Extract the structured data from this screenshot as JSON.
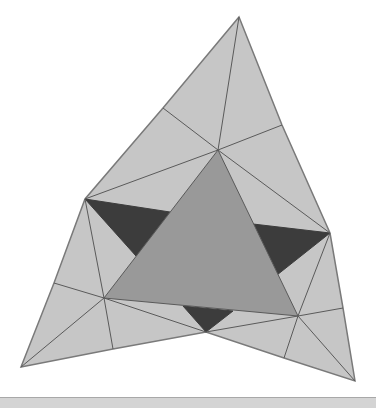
{
  "caption": {
    "text": ""
  },
  "colors": {
    "light": "#c6c6c6",
    "medium": "#999999",
    "dark": "#3c3c3c",
    "stroke": "#5a5a5a",
    "outline": "#7a7a7a"
  },
  "figure": {
    "outer_polygon": [
      [
        239,
        17
      ],
      [
        282,
        125
      ],
      [
        330,
        233
      ],
      [
        343,
        308
      ],
      [
        355,
        381
      ],
      [
        284,
        358
      ],
      [
        206,
        332
      ],
      [
        113,
        349
      ],
      [
        21,
        367
      ],
      [
        54,
        283
      ],
      [
        85,
        199
      ],
      [
        163,
        108
      ]
    ],
    "center_triangle": [
      [
        218,
        150
      ],
      [
        104,
        298
      ],
      [
        298,
        316
      ]
    ],
    "dark_triangles": [
      [
        [
          85,
          199
        ],
        [
          170,
          212
        ],
        [
          136,
          256
        ]
      ],
      [
        [
          253,
          224
        ],
        [
          330,
          233
        ],
        [
          277,
          275
        ]
      ],
      [
        [
          183,
          306
        ],
        [
          233,
          311
        ],
        [
          206,
          332
        ]
      ]
    ],
    "lines": [
      [
        [
          239,
          17
        ],
        [
          218,
          150
        ]
      ],
      [
        [
          163,
          108
        ],
        [
          218,
          150
        ]
      ],
      [
        [
          282,
          125
        ],
        [
          218,
          150
        ]
      ],
      [
        [
          85,
          199
        ],
        [
          218,
          150
        ]
      ],
      [
        [
          330,
          233
        ],
        [
          218,
          150
        ]
      ],
      [
        [
          85,
          199
        ],
        [
          104,
          298
        ]
      ],
      [
        [
          54,
          283
        ],
        [
          104,
          298
        ]
      ],
      [
        [
          21,
          367
        ],
        [
          104,
          298
        ]
      ],
      [
        [
          113,
          349
        ],
        [
          104,
          298
        ]
      ],
      [
        [
          206,
          332
        ],
        [
          104,
          298
        ]
      ],
      [
        [
          330,
          233
        ],
        [
          298,
          316
        ]
      ],
      [
        [
          343,
          308
        ],
        [
          298,
          316
        ]
      ],
      [
        [
          355,
          381
        ],
        [
          298,
          316
        ]
      ],
      [
        [
          284,
          358
        ],
        [
          298,
          316
        ]
      ],
      [
        [
          206,
          332
        ],
        [
          298,
          316
        ]
      ]
    ]
  }
}
